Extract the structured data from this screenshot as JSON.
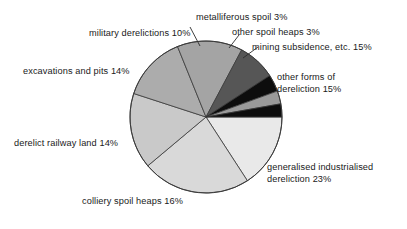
{
  "chart_data": {
    "type": "pie",
    "title": "",
    "subtitle": "",
    "xlabel": "",
    "ylabel": "",
    "legend_position": "none",
    "grid": false,
    "units": "percent",
    "total": 100,
    "categories": [
      "other forms of dereliction",
      "generalised industrialised dereliction",
      "colliery spoil heaps",
      "derelict railway land",
      "excavations and pits",
      "military derelictions",
      "metalliferous spoil",
      "other spoil heaps",
      "mining subsidence, etc."
    ],
    "values": [
      15,
      23,
      16,
      14,
      14,
      10,
      3,
      3,
      15
    ],
    "slices": [
      {
        "id": "other-forms",
        "name": "other forms of dereliction",
        "value": 15,
        "label": "other forms of",
        "label_line2": "dereliction 15%",
        "color": "#e9e9e9",
        "start_deg": 0,
        "end_deg": 57,
        "leader": false
      },
      {
        "id": "generalised",
        "name": "generalised industrialised dereliction",
        "value": 23,
        "label": "generalised industrialised",
        "label_line2": "dereliction 23%",
        "color": "#d9d9d9",
        "start_deg": 57,
        "end_deg": 140,
        "leader": false
      },
      {
        "id": "colliery",
        "name": "colliery spoil heaps",
        "value": 16,
        "label": "colliery spoil heaps 16%",
        "label_line2": "",
        "color": "#c9c9c9",
        "start_deg": 140,
        "end_deg": 198,
        "leader": false
      },
      {
        "id": "railway",
        "name": "derelict railway land",
        "value": 14,
        "label": "derelict railway land 14%",
        "label_line2": "",
        "color": "#acacac",
        "start_deg": 198,
        "end_deg": 248,
        "leader": false
      },
      {
        "id": "excavations",
        "name": "excavations and pits",
        "value": 14,
        "label": "excavations and pits 14%",
        "label_line2": "",
        "color": "#a4a4a4",
        "start_deg": 248,
        "end_deg": 298,
        "leader": false
      },
      {
        "id": "military",
        "name": "military derelictions",
        "value": 10,
        "label": "military derelictions 10%",
        "label_line2": "",
        "color": "#565656",
        "start_deg": 298,
        "end_deg": 327,
        "leader": false
      },
      {
        "id": "metalliferous",
        "name": "metalliferous spoil",
        "value": 3,
        "label": "metalliferous spoil 3%",
        "label_line2": "",
        "color": "#0d0d0d",
        "start_deg": 327,
        "end_deg": 340,
        "leader": true
      },
      {
        "id": "other-spoil",
        "name": "other spoil heaps",
        "value": 3,
        "label": "other spoil heaps 3%",
        "label_line2": "",
        "color": "#9a9a9a",
        "start_deg": 340,
        "end_deg": 350,
        "leader": true
      },
      {
        "id": "mining-subsidence",
        "name": "mining subsidence, etc.",
        "value": 15,
        "label": "mining subsidence, etc. 15%",
        "label_line2": "",
        "color": "#0d0d0d",
        "start_deg": 350,
        "end_deg": 360,
        "leader": true
      }
    ],
    "geometry": {
      "center_x": 206,
      "center_y": 117,
      "radius": 76
    },
    "colors": {
      "outline": "#3a3a3a",
      "background": "#ffffff",
      "text": "#1a1a1a"
    }
  }
}
